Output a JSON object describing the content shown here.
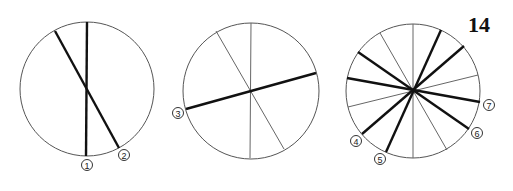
{
  "page_number": "14",
  "figures": [
    {
      "id": "circle-a",
      "center": [
        87,
        89
      ],
      "radius": 67,
      "lines": [
        {
          "from": [
            87,
            22
          ],
          "to": [
            86,
            156
          ],
          "weight": "thick",
          "label": "1"
        },
        {
          "from": [
            55,
            31
          ],
          "to": [
            119,
            148
          ],
          "weight": "thick",
          "label": "2"
        }
      ]
    },
    {
      "id": "circle-b",
      "center": [
        251,
        91
      ],
      "radius": 68,
      "lines": [
        {
          "from": [
            251,
            23
          ],
          "to": [
            250,
            158
          ],
          "weight": "thin"
        },
        {
          "from": [
            216,
            31
          ],
          "to": [
            284,
            149
          ],
          "weight": "thin"
        },
        {
          "from": [
            186,
            109
          ],
          "to": [
            316,
            73
          ],
          "weight": "thick",
          "label": "3"
        }
      ]
    },
    {
      "id": "circle-c",
      "center": [
        413,
        91
      ],
      "radius": 67,
      "lines": [
        {
          "from": [
            413,
            24
          ],
          "to": [
            413,
            158
          ],
          "weight": "thin"
        },
        {
          "from": [
            380,
            33
          ],
          "to": [
            447,
            150
          ],
          "weight": "thin"
        },
        {
          "from": [
            348,
            107
          ],
          "to": [
            478,
            75
          ],
          "weight": "thin"
        },
        {
          "from": [
            358,
            52
          ],
          "to": [
            469,
            129
          ],
          "weight": "thick",
          "label": "6"
        },
        {
          "from": [
            347,
            78
          ],
          "to": [
            480,
            102
          ],
          "weight": "thick",
          "label": "7"
        },
        {
          "from": [
            362,
            134
          ],
          "to": [
            464,
            46
          ],
          "weight": "thick",
          "label": "4"
        },
        {
          "from": [
            386,
            152
          ],
          "to": [
            441,
            30
          ],
          "weight": "thick",
          "label": "5"
        }
      ]
    }
  ],
  "labels": [
    {
      "text": "1",
      "pos": [
        87,
        165
      ]
    },
    {
      "text": "2",
      "pos": [
        124,
        155
      ]
    },
    {
      "text": "3",
      "pos": [
        178,
        113
      ]
    },
    {
      "text": "4",
      "pos": [
        356,
        141
      ]
    },
    {
      "text": "5",
      "pos": [
        380,
        159
      ]
    },
    {
      "text": "6",
      "pos": [
        477,
        133
      ]
    },
    {
      "text": "7",
      "pos": [
        489,
        105
      ]
    }
  ]
}
